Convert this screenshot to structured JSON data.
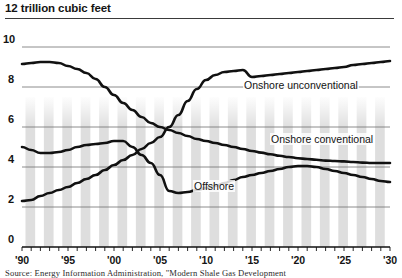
{
  "figure": {
    "unit_title": "12 trillion cubic feet",
    "source_note": "Source: Energy Information Administration, \"Modern Shale Gas Development"
  },
  "chart_data": {
    "type": "line",
    "title": "",
    "subtitle": "",
    "xlabel": "",
    "ylabel": "trillion cubic feet",
    "unit_note": "12 trillion cubic feet",
    "grid": true,
    "legend_position": "inline-annotations",
    "xlim": [
      1990,
      2030
    ],
    "ylim": [
      0,
      10
    ],
    "yticks": [
      0,
      2,
      4,
      6,
      8,
      10
    ],
    "ytick_labels": [
      "0",
      "2",
      "4",
      "6",
      "8",
      "10"
    ],
    "xticks": [
      1990,
      1995,
      2000,
      2005,
      2010,
      2015,
      2020,
      2025,
      2030
    ],
    "xtick_labels": [
      "'90",
      "'95",
      "'00",
      "'05",
      "'10",
      "'15",
      "'20",
      "'25",
      "'30"
    ],
    "x": [
      1990,
      1991,
      1992,
      1993,
      1994,
      1995,
      1996,
      1997,
      1998,
      1999,
      2000,
      2001,
      2002,
      2003,
      2004,
      2005,
      2006,
      2007,
      2008,
      2009,
      2010,
      2011,
      2012,
      2013,
      2014,
      2015,
      2016,
      2017,
      2018,
      2019,
      2020,
      2021,
      2022,
      2023,
      2024,
      2025,
      2026,
      2027,
      2028,
      2029,
      2030
    ],
    "series": [
      {
        "name": "Onshore conventional",
        "label": "Onshore conventional",
        "color": "#111111",
        "values": [
          9.15,
          9.2,
          9.25,
          9.25,
          9.2,
          9.05,
          8.9,
          8.7,
          8.4,
          8.0,
          7.6,
          7.2,
          6.85,
          6.5,
          6.2,
          6.0,
          5.85,
          5.7,
          5.55,
          5.4,
          5.3,
          5.2,
          5.1,
          5.0,
          4.9,
          4.8,
          4.72,
          4.64,
          4.56,
          4.5,
          4.44,
          4.4,
          4.36,
          4.32,
          4.3,
          4.28,
          4.25,
          4.22,
          4.2,
          4.2,
          4.2
        ]
      },
      {
        "name": "Offshore",
        "label": "Offshore",
        "color": "#111111",
        "values": [
          5.0,
          4.85,
          4.7,
          4.7,
          4.75,
          4.85,
          5.0,
          5.1,
          5.15,
          5.2,
          5.3,
          5.3,
          5.0,
          4.6,
          4.2,
          3.6,
          2.8,
          2.7,
          2.75,
          2.85,
          2.95,
          3.05,
          3.2,
          3.35,
          3.5,
          3.6,
          3.7,
          3.8,
          3.9,
          4.0,
          4.05,
          4.05,
          4.0,
          3.9,
          3.8,
          3.7,
          3.6,
          3.5,
          3.4,
          3.3,
          3.25
        ]
      },
      {
        "name": "Onshore unconventional",
        "label": "Onshore unconventional",
        "color": "#111111",
        "values": [
          2.3,
          2.35,
          2.55,
          2.7,
          2.85,
          3.0,
          3.2,
          3.4,
          3.6,
          3.85,
          4.1,
          4.35,
          4.6,
          4.9,
          5.2,
          5.5,
          6.0,
          6.6,
          7.3,
          7.9,
          8.35,
          8.6,
          8.75,
          8.8,
          8.85,
          8.5,
          8.55,
          8.6,
          8.65,
          8.7,
          8.75,
          8.8,
          8.85,
          8.9,
          8.95,
          9.0,
          9.1,
          9.15,
          9.2,
          9.25,
          9.3
        ]
      }
    ],
    "annotations": [
      {
        "text": "Onshore unconventional",
        "x": 2014,
        "y": 8.0
      },
      {
        "text": "Onshore conventional",
        "x": 2020,
        "y": 5.6
      },
      {
        "text": "Offshore",
        "x": 2008,
        "y": 2.9
      }
    ]
  }
}
